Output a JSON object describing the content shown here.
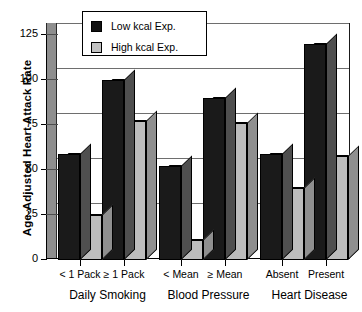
{
  "chart_data": {
    "type": "bar",
    "title": "",
    "subtitle": "",
    "xlabel": "",
    "ylabel": "Age-Adjusted Heart Attack Rate",
    "ylim": [
      0,
      125
    ],
    "yticks": [
      0,
      25,
      50,
      75,
      100,
      125
    ],
    "ytick_labels": [
      "0",
      "25",
      "50",
      "75",
      "100",
      "125"
    ],
    "grid": true,
    "grid_axis": "y",
    "legend_position": "top-center",
    "style": "3d-grouped-bar",
    "categories": [
      "< 1 Pack",
      "≥ 1 Pack",
      "< Mean",
      "≥ Mean",
      "Absent",
      "Present"
    ],
    "groups": [
      {
        "label": "Daily Smoking",
        "categories": [
          "< 1 Pack",
          "≥ 1 Pack"
        ]
      },
      {
        "label": "Blood Pressure",
        "categories": [
          "< Mean",
          "≥ Mean"
        ]
      },
      {
        "label": "Heart Disease",
        "categories": [
          "Absent",
          "Present"
        ]
      }
    ],
    "series": [
      {
        "name": "Low kcal Exp.",
        "color": "#1a1a1a",
        "values": [
          59,
          100,
          52,
          90,
          59,
          120
        ]
      },
      {
        "name": "High kcal Exp.",
        "color": "#bdbdbd",
        "values": [
          25,
          77,
          11,
          76,
          40,
          58
        ]
      }
    ],
    "legend": [
      {
        "label": "Low kcal Exp.",
        "swatch": "low"
      },
      {
        "label": "High kcal Exp.",
        "swatch": "high"
      }
    ]
  }
}
